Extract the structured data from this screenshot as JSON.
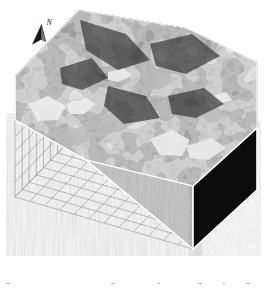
{
  "figure": {
    "type": "3d-block-diagram",
    "background_color": "#ffffff",
    "orientation_marker": {
      "icon": "north-arrow-icon",
      "label": "N",
      "label_style": "italic",
      "arrow_color": "#111111",
      "points_to": "up-right"
    },
    "grid_box": {
      "line_color": "#8a8a8a",
      "line_width_px": 0.5,
      "back_wall_left": {
        "columns": 9,
        "rows": 8
      },
      "back_wall_right": {
        "columns": 12,
        "rows": 8
      },
      "floor": {
        "columns": 12,
        "rows": 9
      },
      "corners": {
        "back_top": [
          79,
          10
        ],
        "left_top": [
          15,
          76
        ],
        "right_top": [
          257,
          62
        ],
        "back_bottom": [
          79,
          131
        ],
        "left_bottom": [
          15,
          197
        ],
        "right_bottom": [
          257,
          177
        ],
        "front_bottom": [
          193,
          249
        ]
      }
    },
    "block": {
      "top_surface": {
        "name": "textured-terrain-surface",
        "fill_description": "mottled dark gray photo/raster drape with light highlight patches",
        "base_color": "#4a4a4a",
        "highlight_color": "#e2e2e2",
        "shadow_color": "#262626"
      },
      "left_face": {
        "name": "left-cross-section-face",
        "fill_description": "uniform light gray with faint vertical striping",
        "color": "#cfcfcf"
      },
      "right_face": {
        "name": "right-cross-section-face",
        "fill_description": "near black cross section",
        "color": "#0d0d0d"
      },
      "edge_color": "#ffffff"
    },
    "caption": {
      "visible": "partial",
      "note": "Only the uppermost pixel row of the caption line is visible; glyphs are cut off by the image crop.",
      "text": "Figure 3. Three-dimensional block diagram of the study area showing the draped image over terrain."
    }
  }
}
